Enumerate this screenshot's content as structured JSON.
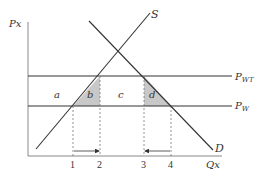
{
  "diagram": {
    "type": "supply-demand-tariff",
    "axes": {
      "y_label": "Px",
      "x_label": "Qx"
    },
    "curves": {
      "supply_label": "S",
      "demand_label": "D"
    },
    "price_lines": {
      "tariff_price_label": "P",
      "tariff_price_sub": "WT",
      "world_price_label": "P",
      "world_price_sub": "W"
    },
    "areas": {
      "a": "a",
      "b": "b",
      "c": "c",
      "d": "d"
    },
    "quantity_ticks": [
      "1",
      "2",
      "3",
      "4"
    ],
    "colors": {
      "line": "#333333",
      "shade": "#c8c8c8",
      "axis": "#888888"
    }
  }
}
